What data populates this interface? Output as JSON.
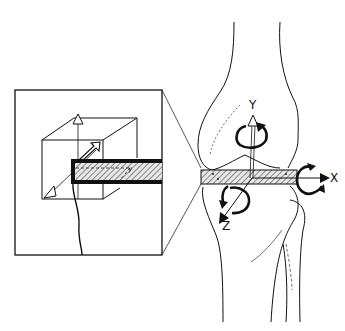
{
  "figure": {
    "colors": {
      "ink": "#111111",
      "background": "#ffffff",
      "hatch": "#555555"
    }
  },
  "axes": {
    "x": {
      "label": "X"
    },
    "y": {
      "label": "Y"
    },
    "z": {
      "label": "Z"
    }
  },
  "inset": {
    "label": "magnified-detail"
  }
}
